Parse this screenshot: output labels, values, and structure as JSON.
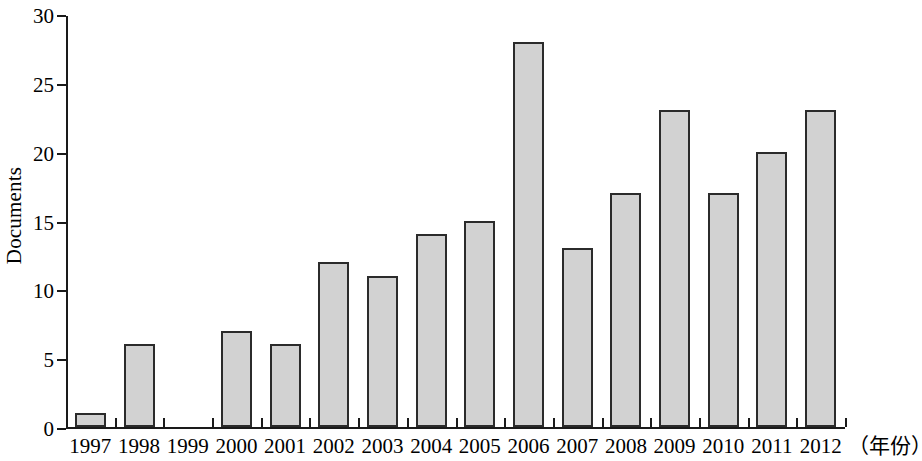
{
  "chart_data": {
    "type": "bar",
    "title": "",
    "subtitle": "",
    "xlabel": "（年份）",
    "ylabel": "Documents",
    "categories": [
      "1997",
      "1998",
      "1999",
      "2000",
      "2001",
      "2002",
      "2003",
      "2004",
      "2005",
      "2006",
      "2007",
      "2008",
      "2009",
      "2010",
      "2011",
      "2012"
    ],
    "values": [
      1,
      6,
      0,
      7,
      6,
      12,
      11,
      14,
      15,
      28,
      13,
      17,
      23,
      17,
      20,
      23
    ],
    "ylim": [
      0,
      30
    ],
    "yticks": [
      0,
      5,
      10,
      15,
      20,
      25,
      30
    ],
    "ytick_labels": [
      "0",
      "5",
      "10",
      "15",
      "20",
      "25",
      "30"
    ],
    "grid": false,
    "legend": false,
    "legend_position": "none",
    "bar_fill_color": "#d2d2d2",
    "bar_border_color": "#2b2b2b",
    "axis_color": "#1a1a1a",
    "background_color": "#ffffff"
  }
}
